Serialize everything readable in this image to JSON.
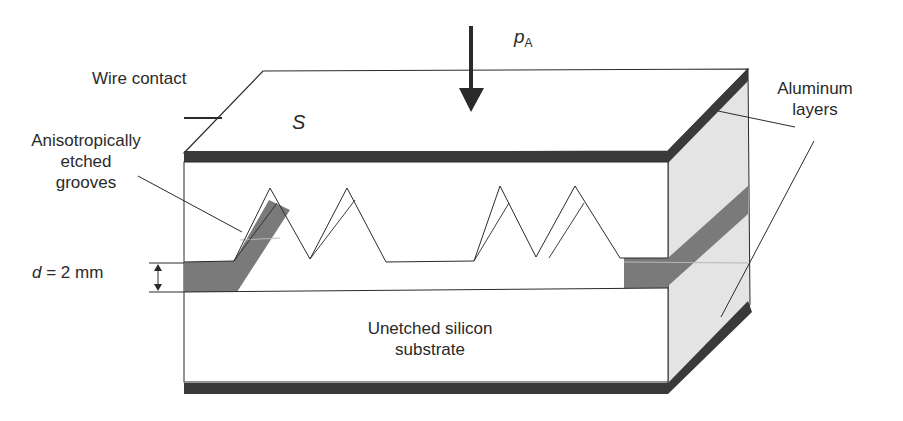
{
  "diagram": {
    "labels": {
      "wire_contact": "Wire contact",
      "surface_symbol": "S",
      "pressure_symbol": "p",
      "pressure_subscript": "A",
      "grooves_line1": "Anisotropically",
      "grooves_line2": "etched",
      "grooves_line3": "grooves",
      "thickness_var": "d",
      "thickness_value": " = 2 mm",
      "aluminum_line1": "Aluminum",
      "aluminum_line2": "layers",
      "substrate_line1": "Unetched silicon",
      "substrate_line2": "substrate"
    },
    "colors": {
      "aluminum_dark": "#3a3a3a",
      "side_face": "#e4e4e4",
      "etched_fill": "#7a7a7a",
      "line": "#2a2a2a",
      "background": "#ffffff"
    }
  }
}
